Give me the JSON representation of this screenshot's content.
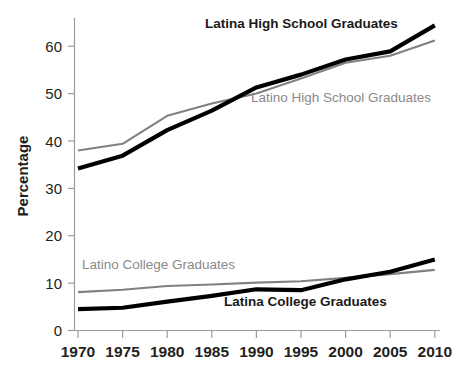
{
  "chart_data": {
    "type": "line",
    "title": "",
    "xlabel": "",
    "ylabel": "Percentage",
    "x": [
      1970,
      1975,
      1980,
      1985,
      1990,
      1995,
      2000,
      2005,
      2010
    ],
    "xticklabels": [
      "1970",
      "1975",
      "1980",
      "1985",
      "1990",
      "1995",
      "2000",
      "2005",
      "2010"
    ],
    "yticklabels": [
      "0",
      "10",
      "20",
      "30",
      "40",
      "50",
      "60"
    ],
    "yticks": [
      0,
      10,
      20,
      30,
      40,
      50,
      60
    ],
    "xlim": [
      1970,
      2010
    ],
    "ylim": [
      0,
      66
    ],
    "grid": false,
    "legend_position": "inline-annotations",
    "series": [
      {
        "name": "Latina High School Graduates",
        "color": "#000000",
        "values": [
          34.2,
          36.9,
          42.3,
          46.4,
          51.3,
          54.0,
          57.2,
          58.9,
          64.4
        ]
      },
      {
        "name": "Latino High School Graduates",
        "color": "#808080",
        "values": [
          38.0,
          39.4,
          45.3,
          47.9,
          50.0,
          53.2,
          56.5,
          58.0,
          61.2
        ]
      },
      {
        "name": "Latina College Graduates",
        "color": "#000000",
        "values": [
          4.5,
          4.8,
          6.1,
          7.3,
          8.7,
          8.5,
          10.8,
          12.4,
          15.0
        ]
      },
      {
        "name": "Latino College Graduates",
        "color": "#808080",
        "values": [
          8.1,
          8.6,
          9.4,
          9.7,
          10.1,
          10.4,
          11.1,
          11.9,
          12.8
        ]
      }
    ],
    "annotations": [
      {
        "text": "Latina High School Graduates",
        "series": "Latina High School Graduates",
        "color": "#1a1a1a",
        "x": 205,
        "y": 28
      },
      {
        "text": "Latino High School Graduates",
        "series": "Latino High School Graduates",
        "color": "#8a8a8a",
        "x": 251,
        "y": 102
      },
      {
        "text": "Latino College Graduates",
        "series": "Latino College Graduates",
        "color": "#8a8a8a",
        "x": 82,
        "y": 269
      },
      {
        "text": "Latina College Graduates",
        "series": "Latina College Graduates",
        "color": "#1a1a1a",
        "x": 224,
        "y": 306
      }
    ]
  },
  "axes": {
    "y_title": "Percentage",
    "y_tick_0": "0",
    "y_tick_10": "10",
    "y_tick_20": "20",
    "y_tick_30": "30",
    "y_tick_40": "40",
    "y_tick_50": "50",
    "y_tick_60": "60",
    "x_tick_1970": "1970",
    "x_tick_1975": "1975",
    "x_tick_1980": "1980",
    "x_tick_1985": "1985",
    "x_tick_1990": "1990",
    "x_tick_1995": "1995",
    "x_tick_2000": "2000",
    "x_tick_2005": "2005",
    "x_tick_2010": "2010"
  },
  "series_labels": {
    "latina_hs": "Latina High School Graduates",
    "latino_hs": "Latino High School Graduates",
    "latina_college": "Latina College Graduates",
    "latino_college": "Latina College Graduates"
  },
  "labels": {
    "latina_hs": "Latina High School Graduates",
    "latino_hs": "Latino High School Graduates",
    "latino_college": "Latino College Graduates",
    "latina_college": "Latina College Graduates"
  }
}
